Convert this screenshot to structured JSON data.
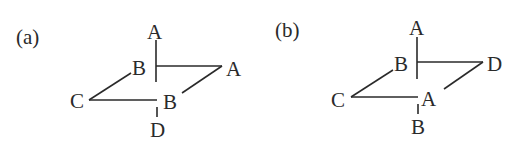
{
  "panels": [
    {
      "id": "a",
      "label": "(a)",
      "atoms": {
        "top": "A",
        "back_left": "B",
        "right": "A",
        "left": "C",
        "front": "B",
        "bottom": "D"
      }
    },
    {
      "id": "b",
      "label": "(b)",
      "atoms": {
        "top": "A",
        "back_left": "B",
        "right": "D",
        "left": "C",
        "front": "A",
        "bottom": "B"
      }
    }
  ]
}
